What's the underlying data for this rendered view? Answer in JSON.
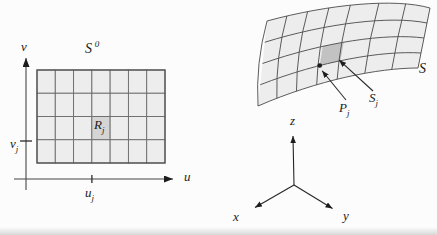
{
  "left": {
    "title": {
      "base": "S",
      "sup": "0"
    },
    "region": {
      "base": "R",
      "sub": "j"
    },
    "v_axis_label": "v",
    "u_axis_label": "u",
    "v_coord": {
      "base": "v",
      "sub": "j"
    },
    "u_coord": {
      "base": "u",
      "sub": "j"
    },
    "grid": {
      "cols": 7,
      "rows": 4,
      "highlight_col": 4,
      "highlight_row": 3
    }
  },
  "right": {
    "surface_label": "S",
    "patch": {
      "base": "S",
      "sub": "j"
    },
    "point": {
      "base": "P",
      "sub": "j"
    },
    "axis_x": "x",
    "axis_y": "y",
    "axis_z": "z",
    "grid": {
      "cols": 7,
      "rows": 4,
      "highlight_col": 4,
      "highlight_row": 3
    }
  },
  "colors": {
    "background": "#fcfcfc",
    "cell_fill": "#ededed",
    "region_highlight": "#d5d5d5",
    "patch_highlight": "#c2c2c2",
    "grid_line": "#6b6b6b",
    "mesh_line": "#4a4a4a",
    "axis_line": "#454545",
    "ink": "#1c1c1c"
  }
}
